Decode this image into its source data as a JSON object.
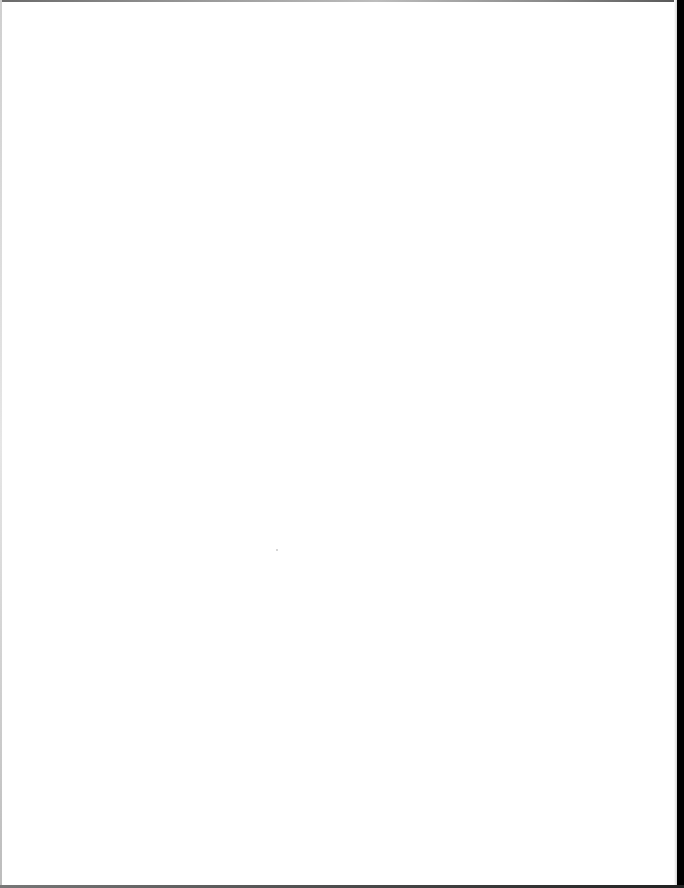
{
  "document": {
    "type": "scanned-page",
    "content": "",
    "colors": {
      "paper": "#ffffff",
      "right_border": "#000000",
      "edge_shadow": "#6a6a6a"
    }
  }
}
